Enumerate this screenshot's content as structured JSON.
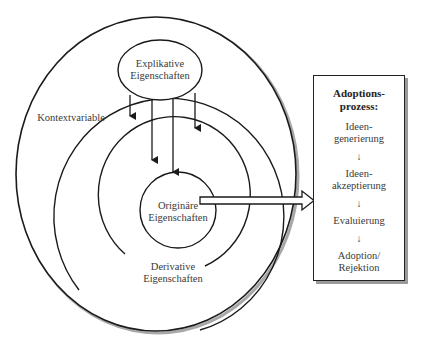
{
  "diagram": {
    "outer_label": "Kontextvariable",
    "explicative": {
      "line1": "Explikative",
      "line2": "Eigenschaften"
    },
    "original": {
      "line1": "Originäre",
      "line2": "Eigenschaften"
    },
    "derivative": {
      "line1": "Derivative",
      "line2": "Eigenschaften"
    },
    "process_box": {
      "title_line1": "Adoptions-",
      "title_line2": "prozess:",
      "steps": [
        {
          "line1": "Ideen-",
          "line2": "generierung"
        },
        {
          "line1": "Ideen-",
          "line2": "akzeptierung"
        },
        {
          "line1": "Evaluierung",
          "line2": ""
        },
        {
          "line1": "Adoption/",
          "line2": "Rejektion"
        }
      ],
      "step_arrow": "↓"
    },
    "colors": {
      "line": "#1a1a1a",
      "text": "#3a3a3a",
      "shadow": "#9a9a9a"
    }
  }
}
